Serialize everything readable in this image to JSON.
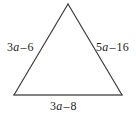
{
  "figure": {
    "type": "geometry-diagram",
    "shape": "triangle",
    "stroke_color": "#3c3c3c",
    "base_stroke_color": "#5a5a5a",
    "background_color": "#ffffff",
    "text_color": "#231f20",
    "vertices": {
      "apex": {
        "x": 68,
        "y": 4
      },
      "bottom_left": {
        "x": 14,
        "y": 95
      },
      "bottom_right": {
        "x": 122,
        "y": 95
      }
    },
    "labels": {
      "left_side": {
        "text": "3a – 6",
        "coefficient": "3",
        "variable": "a",
        "operator": "–",
        "constant": "6"
      },
      "right_side": {
        "text": "5a – 16",
        "coefficient": "5",
        "variable": "a",
        "operator": "–",
        "constant": "16"
      },
      "bottom_side": {
        "text": "3a – 8",
        "coefficient": "3",
        "variable": "a",
        "operator": "–",
        "constant": "8"
      }
    }
  }
}
